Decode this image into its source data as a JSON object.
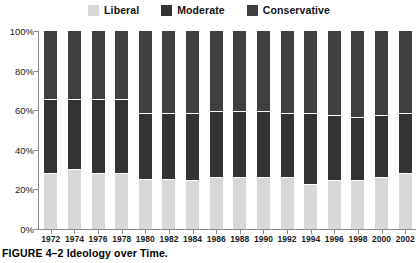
{
  "caption": "FIGURE 4–2  Ideology over Time.",
  "legend": {
    "items": [
      {
        "label": "Liberal",
        "color": "#d8d8d8",
        "swatch_name": "legend-swatch-liberal"
      },
      {
        "label": "Moderate",
        "color": "#333333",
        "swatch_name": "legend-swatch-moderate"
      },
      {
        "label": "Conservative",
        "color": "#3f3f3f",
        "swatch_name": "legend-swatch-conservative"
      }
    ]
  },
  "axes": {
    "y_ticks": [
      "0%",
      "20%",
      "40%",
      "60%",
      "80%",
      "100%"
    ],
    "y_values": [
      0,
      20,
      40,
      60,
      80,
      100
    ]
  },
  "chart_data": {
    "type": "bar",
    "stacked": true,
    "stack_mode": "percent",
    "title": "Ideology over Time",
    "xlabel": "",
    "ylabel": "",
    "ylim": [
      0,
      100
    ],
    "yticks": [
      0,
      20,
      40,
      60,
      80,
      100
    ],
    "ytick_labels": [
      "0%",
      "20%",
      "40%",
      "60%",
      "80%",
      "100%"
    ],
    "grid": false,
    "legend_position": "top-center",
    "categories": [
      "1972",
      "1974",
      "1976",
      "1978",
      "1980",
      "1982",
      "1984",
      "1986",
      "1988",
      "1990",
      "1992",
      "1994",
      "1996",
      "1998",
      "2000",
      "2002"
    ],
    "series": [
      {
        "name": "Liberal",
        "color": "#d8d8d8",
        "values": [
          28,
          30,
          28,
          28,
          25,
          25,
          24,
          26,
          26,
          26,
          26,
          22,
          24,
          24,
          26,
          28
        ]
      },
      {
        "name": "Moderate",
        "color": "#333333",
        "values": [
          37,
          35,
          37,
          37,
          33,
          33,
          34,
          33,
          33,
          33,
          32,
          36,
          33,
          32,
          31,
          30
        ]
      },
      {
        "name": "Conservative",
        "color": "#3f3f3f",
        "values": [
          35,
          35,
          35,
          35,
          42,
          42,
          42,
          41,
          41,
          41,
          42,
          42,
          43,
          44,
          43,
          42
        ]
      }
    ],
    "liberal_moderate_boundary": [
      28,
      30,
      28,
      28,
      25,
      25,
      24,
      26,
      26,
      26,
      26,
      22,
      24,
      24,
      26,
      28
    ],
    "moderate_conservative_boundary": [
      65,
      65,
      65,
      65,
      58,
      58,
      58,
      59,
      59,
      59,
      58,
      58,
      57,
      56,
      57,
      58
    ]
  }
}
